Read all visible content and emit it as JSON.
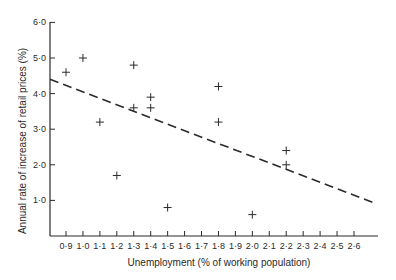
{
  "chart_data": {
    "type": "scatter",
    "title": "",
    "xlabel": "Unemployment (% of working population)",
    "ylabel": "Annual  rate of increase of retail prices (%)",
    "xlim": [
      0.8,
      2.74
    ],
    "ylim": [
      0,
      6.0
    ],
    "x_ticks": [
      0.9,
      1.0,
      1.1,
      1.2,
      1.3,
      1.4,
      1.5,
      1.6,
      1.7,
      1.8,
      1.9,
      2.0,
      2.1,
      2.2,
      2.3,
      2.4,
      2.5,
      2.6
    ],
    "x_tick_labels": [
      "0·9",
      "1·0",
      "1·1",
      "1·2",
      "1·3",
      "1·4",
      "1·5",
      "1·6",
      "1·7",
      "1·8",
      "1·9",
      "2·0",
      "2·1",
      "2·2",
      "2·3",
      "2·4",
      "2·5",
      "2·6"
    ],
    "y_ticks": [
      1.0,
      2.0,
      3.0,
      4.0,
      5.0,
      6.0
    ],
    "y_tick_labels": [
      "1·0",
      "2·0",
      "3·0",
      "4·0",
      "5·0",
      "6·0"
    ],
    "grid": false,
    "legend": null,
    "marker": "+",
    "points": [
      {
        "x": 0.9,
        "y": 4.6
      },
      {
        "x": 1.0,
        "y": 5.0
      },
      {
        "x": 1.1,
        "y": 3.2
      },
      {
        "x": 1.2,
        "y": 1.7
      },
      {
        "x": 1.3,
        "y": 4.8
      },
      {
        "x": 1.3,
        "y": 3.6
      },
      {
        "x": 1.4,
        "y": 3.9
      },
      {
        "x": 1.4,
        "y": 3.6
      },
      {
        "x": 1.5,
        "y": 0.8
      },
      {
        "x": 1.8,
        "y": 4.2
      },
      {
        "x": 1.8,
        "y": 3.2
      },
      {
        "x": 2.0,
        "y": 0.6
      },
      {
        "x": 2.2,
        "y": 2.4
      },
      {
        "x": 2.2,
        "y": 2.0
      }
    ],
    "trend_line": {
      "style": "dashed",
      "start": {
        "x": 0.8,
        "y": 4.4
      },
      "end": {
        "x": 2.74,
        "y": 0.9
      }
    }
  },
  "colors": {
    "ink": "#2a2a2a",
    "background": "#ffffff"
  }
}
